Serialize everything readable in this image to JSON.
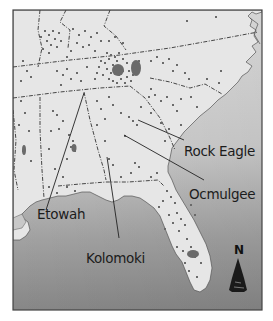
{
  "map": {
    "title": "",
    "region": "Southeastern United States",
    "colors": {
      "land": "#e4e4e4",
      "water_top": "#dcdcdc",
      "water_bottom": "#8a8a8a",
      "sites": "#6e6e6e",
      "border": "#3a3a3a",
      "frame": "#444444",
      "label": "#1c1c1c"
    },
    "labels": [
      {
        "id": "rock-eagle",
        "text": "Rock Eagle",
        "x": 184,
        "y": 156,
        "line": [
          [
            138,
            120
          ],
          [
            184,
            140
          ]
        ]
      },
      {
        "id": "ocmulgee",
        "text": "Ocmulgee",
        "x": 189,
        "y": 199,
        "line": [
          [
            124,
            135
          ],
          [
            204,
            180
          ]
        ]
      },
      {
        "id": "etowah",
        "text": "Etowah",
        "x": 37,
        "y": 219,
        "line": [
          [
            46,
            210
          ],
          [
            84,
            93
          ]
        ]
      },
      {
        "id": "kolomoki",
        "text": "Kolomoki",
        "x": 86,
        "y": 263,
        "line": [
          [
            119,
            238
          ],
          [
            107,
            157
          ]
        ]
      }
    ],
    "north_arrow": {
      "label": "N",
      "icon": "north-arrow-icon"
    }
  }
}
